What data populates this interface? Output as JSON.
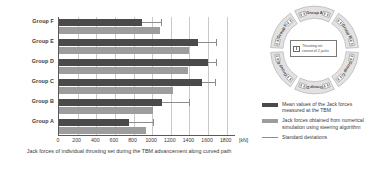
{
  "chart_data": {
    "type": "bar",
    "orientation": "horizontal",
    "title": "",
    "xlabel": "Jack forces of individual thrusting set during the TBM advancement along curved path",
    "ylabel": "",
    "xunit": "[kN]",
    "xlim": [
      0,
      1900
    ],
    "xticks": [
      0,
      200,
      400,
      600,
      800,
      1000,
      1200,
      1400,
      1600,
      1800
    ],
    "grid": true,
    "legend_position": "right",
    "categories": [
      "Group F",
      "Group E",
      "Group D",
      "Group C",
      "Group B",
      "Group A"
    ],
    "series": [
      {
        "name": "Mean values of the Jack forces measured at the TBM",
        "color": "#4a4a4a",
        "values": [
          890,
          1490,
          1600,
          1540,
          1110,
          750
        ],
        "errors_upper": [
          1090,
          1690,
          1690,
          1670,
          1400,
          1010
        ]
      },
      {
        "name": "Jack forces obtained from numerical simulation using steering algorithm",
        "color": "#9d9d9d",
        "values": [
          1080,
          1400,
          1380,
          1220,
          1010,
          930
        ]
      }
    ]
  },
  "legend": {
    "items": [
      {
        "key": "mean",
        "label": "Mean values of the Jack forces measured at the TBM"
      },
      {
        "key": "sim",
        "label": "Jack forces obtained from numerical simulation using steering algorithm"
      },
      {
        "key": "std",
        "label": "Standard deviations"
      }
    ]
  },
  "ring": {
    "groups": [
      "Group A",
      "Group B",
      "Group C",
      "Group D",
      "Group E",
      "Group F"
    ],
    "center_note": "Thrusting set consist of 2 jacks"
  }
}
